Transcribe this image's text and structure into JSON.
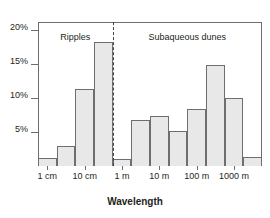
{
  "chart_data": {
    "type": "bar",
    "title": "",
    "xlabel": "Wavelength",
    "ylabel": "",
    "ylim": [
      0,
      21.2
    ],
    "grid": false,
    "legend": false,
    "y_ticks": [
      {
        "value": 5,
        "label": "5%"
      },
      {
        "value": 10,
        "label": "10%"
      },
      {
        "value": 15,
        "label": "15%"
      },
      {
        "value": 20,
        "label": "20%"
      }
    ],
    "x_ticks": [
      {
        "index": 0.5,
        "label": "1 cm"
      },
      {
        "index": 2.5,
        "label": "10 cm"
      },
      {
        "index": 4.5,
        "label": "1 m"
      },
      {
        "index": 6.5,
        "label": "10 m"
      },
      {
        "index": 8.5,
        "label": "100 m"
      },
      {
        "index": 10.5,
        "label": "1000 m"
      }
    ],
    "categories": [
      "1 cm",
      "3 cm",
      "10 cm",
      "30 cm",
      "1 m",
      "3 m",
      "10 m",
      "30 m",
      "100 m",
      "300 m",
      "1000 m",
      "3000 m"
    ],
    "values": [
      1.2,
      3.0,
      11.3,
      18.2,
      1.0,
      6.8,
      7.3,
      5.2,
      8.4,
      14.9,
      10.0,
      1.4
    ],
    "annotations": [
      {
        "text": "Ripples",
        "x_index": 2.0,
        "y": 19.8
      },
      {
        "text": "Subaqueous dunes",
        "x_index": 8.0,
        "y": 19.8
      }
    ],
    "divider": {
      "x_index": 4.0,
      "style": "dashed",
      "label": "ripples / subaqueous dunes boundary"
    },
    "colors": {
      "bar_fill": "#e8e8e8",
      "bar_stroke": "#6e6e6e",
      "axis": "#6e6e6e",
      "text": "#231f20",
      "divider": "#444444",
      "background": "#ffffff"
    }
  }
}
